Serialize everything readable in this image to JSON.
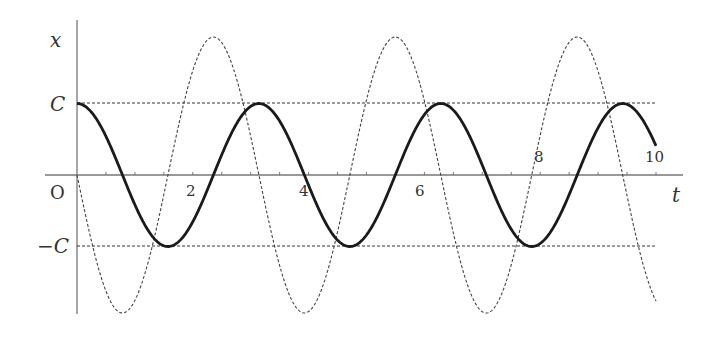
{
  "chart_data": {
    "type": "line",
    "title": "",
    "xlabel": "t",
    "ylabel": "x",
    "origin_label": "O",
    "xlim": [
      0,
      10
    ],
    "ylim": [
      "-2C",
      "2C"
    ],
    "x_ticks": [
      2,
      4,
      6,
      8,
      10
    ],
    "x_minor_tick_step": 0.5,
    "y_ticks": [
      "C",
      "-C"
    ],
    "y_tick_labels": [
      "C",
      "−C"
    ],
    "grid": false,
    "legend": null,
    "series": [
      {
        "name": "x = C cos 2t",
        "style": "solid-thick",
        "color": "#1a1a1a",
        "amplitude": "C",
        "omega": 2,
        "function": "cos",
        "phase_sign": 1,
        "key_points": [
          {
            "t": 0,
            "x": "C"
          },
          {
            "t": 1.571,
            "x": "-C"
          },
          {
            "t": 3.142,
            "x": "C"
          },
          {
            "t": 4.712,
            "x": "-C"
          },
          {
            "t": 6.283,
            "x": "C"
          },
          {
            "t": 7.854,
            "x": "-C"
          },
          {
            "t": 9.425,
            "x": "C"
          }
        ]
      },
      {
        "name": "dx/dt = -2C sin 2t",
        "style": "dashed-thin",
        "color": "#444444",
        "amplitude": "2C",
        "omega": 2,
        "function": "sin",
        "phase_sign": -1,
        "key_points": [
          {
            "t": 0,
            "x": 0
          },
          {
            "t": 0.785,
            "x": "-2C"
          },
          {
            "t": 2.356,
            "x": "2C"
          },
          {
            "t": 3.927,
            "x": "-2C"
          },
          {
            "t": 5.498,
            "x": "2C"
          },
          {
            "t": 7.069,
            "x": "-2C"
          },
          {
            "t": 8.639,
            "x": "2C"
          }
        ]
      }
    ],
    "reference_lines": [
      {
        "y": "C",
        "style": "dashed",
        "t_range": [
          0,
          10
        ]
      },
      {
        "y": "-C",
        "style": "dashed",
        "t_range": [
          0,
          10
        ]
      }
    ]
  },
  "labels": {
    "y_axis": "x",
    "x_axis": "t",
    "origin": "O",
    "c_pos": "C",
    "c_neg": "−C",
    "tick_2": "2",
    "tick_4": "4",
    "tick_6": "6",
    "tick_8": "8",
    "tick_10": "10"
  }
}
